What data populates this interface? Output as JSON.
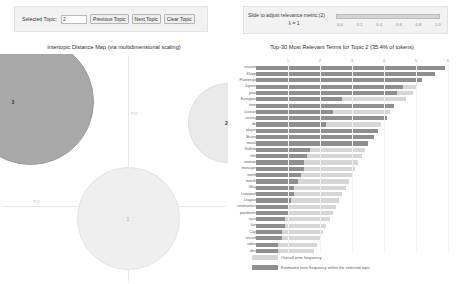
{
  "controls": {
    "selected_topic_label": "Selected Topic:",
    "selected_topic_value": "2",
    "previous_topic_label": "Previous Topic",
    "next_topic_label": "Next Topic",
    "clear_topic_label": "Clear Topic"
  },
  "slider": {
    "label": "Slide to adjust relevance metric:(2)",
    "lambda_label": "λ = 1",
    "value": 1,
    "ticks": [
      "0.0",
      "0.2",
      "0.4",
      "0.6",
      "0.8",
      "1.0"
    ]
  },
  "map": {
    "title": "Intertopic Distance Map (via multidimensional scaling)",
    "x_axis_label": "PC1",
    "y_axis_label": "PC2",
    "topics": [
      {
        "id": "3",
        "label": "3"
      },
      {
        "id": "2",
        "label": "2"
      },
      {
        "id": "1",
        "label": "1"
      }
    ]
  },
  "bars": {
    "title": "Top-30 Most Relevant Terms for Topic 2 (35.4% of tokens)",
    "legend": [
      {
        "swatch": "#d6d6d6",
        "text": "Overall term frequency"
      },
      {
        "swatch": "#8f8f8f",
        "text": "Estimated term frequency within the selected topic"
      }
    ]
  },
  "chart_data": {
    "type": "bar",
    "title": "Top-30 Most Relevant Terms for Topic 2 (35.4% of tokens)",
    "xlabel": "",
    "ylabel": "",
    "orientation": "horizontal",
    "grid": true,
    "legend_position": "bottom-left",
    "xlim": [
      0,
      6
    ],
    "xticks": [
      1,
      2,
      3,
      4,
      5,
      6
    ],
    "categories": [
      "season",
      "Klopp",
      "Flamengo",
      "Jupern",
      "year",
      "Everglow",
      "time",
      "Lorean",
      "victory",
      "de",
      "player",
      "Bruno",
      "moral",
      "Golfino",
      "title",
      "woman",
      "manager",
      "world",
      "month",
      "May",
      "Liverpool",
      "League",
      "coronavirus",
      "pandemic",
      "race",
      "fan",
      "Cup",
      "record",
      "video",
      "des"
    ],
    "series": [
      {
        "name": "Overall term frequency",
        "color": "#d6d6d6",
        "values": [
          5.9,
          5.6,
          5.2,
          5.0,
          4.9,
          4.7,
          4.3,
          4.2,
          4.1,
          3.9,
          3.8,
          3.7,
          3.5,
          3.4,
          3.3,
          3.2,
          3.1,
          3.0,
          2.9,
          2.8,
          2.7,
          2.6,
          2.5,
          2.4,
          2.3,
          2.2,
          2.1,
          2.0,
          1.9,
          1.8
        ]
      },
      {
        "name": "Estimated term frequency within the selected topic",
        "color": "#8f8f8f",
        "values": [
          5.9,
          5.6,
          5.2,
          4.6,
          4.4,
          2.7,
          4.3,
          2.4,
          4.1,
          2.2,
          3.8,
          3.7,
          3.5,
          1.7,
          1.6,
          1.5,
          1.5,
          1.4,
          1.3,
          1.2,
          1.2,
          1.1,
          1.0,
          1.0,
          0.9,
          0.9,
          0.8,
          0.8,
          0.7,
          0.7
        ]
      }
    ]
  }
}
